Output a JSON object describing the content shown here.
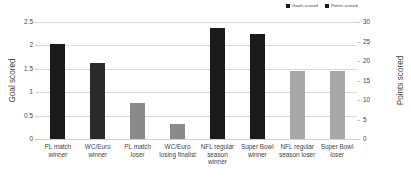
{
  "chart_data": {
    "type": "bar",
    "title": "",
    "xlabel": "",
    "ylabel": "Goal scored",
    "y2label": "Points scored",
    "categories": [
      "PL match winner",
      "WC/Euro winner",
      "PL match loser",
      "WC/Euro losing finalist",
      "NFL regular season winner",
      "Super Bowl winner",
      "NFL regular season loser",
      "Super Bowl loser"
    ],
    "series": [
      {
        "name": "Goals scored",
        "axis": "left",
        "color": "#1a1a1a",
        "values": [
          2.02,
          1.63,
          0.77,
          0.32,
          null,
          null,
          null,
          null
        ]
      },
      {
        "name": "Points scored",
        "axis": "right",
        "color": "#8a8a8a",
        "values": [
          null,
          null,
          null,
          null,
          29.6,
          28.0,
          18.0,
          18.0
        ]
      }
    ],
    "ylim": [
      0,
      2.5
    ],
    "y2lim": [
      0,
      30
    ],
    "yticks": [
      "0",
      "0.5",
      "1",
      "1.5",
      "2",
      "2.5"
    ],
    "y2ticks": [
      "0",
      "5",
      "10",
      "15",
      "20",
      "25",
      "30"
    ],
    "grid": true,
    "legend_position": "top-right"
  },
  "legend": {
    "entries": [
      {
        "label": "Goals scored",
        "color": "#1a1a1a"
      },
      {
        "label": "Points scored",
        "color": "#1a1a1a"
      }
    ]
  },
  "bars": [
    {
      "category": "PL match winner",
      "label_line1": "PL match",
      "label_line2": "winner",
      "label_line3": "",
      "value": 2.02,
      "unit": "goals",
      "color": "#1a1a1a",
      "frac": 0.808
    },
    {
      "category": "WC/Euro winner",
      "label_line1": "WC/Euro",
      "label_line2": "winner",
      "label_line3": "",
      "value": 1.63,
      "unit": "goals",
      "color": "#2a2a2a",
      "frac": 0.652
    },
    {
      "category": "PL match loser",
      "label_line1": "PL match",
      "label_line2": "loser",
      "label_line3": "",
      "value": 0.77,
      "unit": "goals",
      "color": "#8a8a8a",
      "frac": 0.308
    },
    {
      "category": "WC/Euro losing finalist",
      "label_line1": "WC/Euro",
      "label_line2": "losing finalist",
      "label_line3": "",
      "value": 0.32,
      "unit": "goals",
      "color": "#8a8a8a",
      "frac": 0.128
    },
    {
      "category": "NFL regular season winner",
      "label_line1": "NFL regular",
      "label_line2": "season",
      "label_line3": "winner",
      "value": 29.6,
      "unit": "points",
      "color": "#1a1a1a",
      "frac": 0.949
    },
    {
      "category": "Super Bowl winner",
      "label_line1": "Super Bowl",
      "label_line2": "winner",
      "label_line3": "",
      "value": 28.0,
      "unit": "points",
      "color": "#1a1a1a",
      "frac": 0.897
    },
    {
      "category": "NFL regular season loser",
      "label_line1": "NFL regular",
      "label_line2": "season loser",
      "label_line3": "",
      "value": 18.0,
      "unit": "points",
      "color": "#a8a8a8",
      "frac": 0.577
    },
    {
      "category": "Super Bowl loser",
      "label_line1": "Super Bowl",
      "label_line2": "loser",
      "label_line3": "",
      "value": 18.0,
      "unit": "points",
      "color": "#a8a8a8",
      "frac": 0.577
    }
  ],
  "axes": {
    "left": {
      "title": "Goal scored",
      "ticks": [
        "2.5",
        "2",
        "1.5",
        "1",
        "0.5",
        "0"
      ]
    },
    "right": {
      "title": "Points scored",
      "ticks": [
        "30",
        "25",
        "20",
        "15",
        "10",
        "5",
        "0"
      ]
    }
  }
}
